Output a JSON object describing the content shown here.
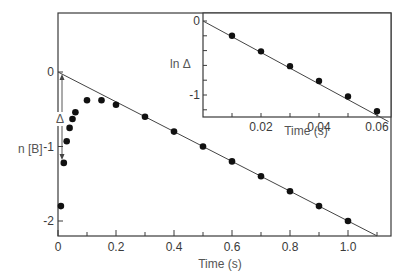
{
  "chart_data": [
    {
      "type": "scatter",
      "title": "",
      "xlabel": "Time (s)",
      "ylabel": "n [B]",
      "xlim": [
        0,
        1.15
      ],
      "ylim": [
        -2.2,
        0.75
      ],
      "xticks": [
        0,
        0.2,
        0.4,
        0.6,
        0.8,
        1.0
      ],
      "xtick_labels": [
        "0",
        "0.2",
        "0.4",
        "0.6",
        "0.8",
        "1.0"
      ],
      "yticks": [
        0,
        -1,
        -2
      ],
      "ytick_labels": [
        "0",
        "-1",
        "-2"
      ],
      "grid": false,
      "annotations": [
        {
          "text": "Δ",
          "x": 0.005,
          "y": -0.6,
          "note": "double arrow from fitted line at t=0 down to data"
        }
      ],
      "series": [
        {
          "name": "data",
          "x": [
            0.01,
            0.02,
            0.03,
            0.04,
            0.05,
            0.06,
            0.1,
            0.15,
            0.2,
            0.3,
            0.4,
            0.5,
            0.6,
            0.7,
            0.8,
            0.9,
            1.0
          ],
          "y": [
            -1.8,
            -1.22,
            -0.93,
            -0.75,
            -0.63,
            -0.54,
            -0.38,
            -0.38,
            -0.44,
            -0.6,
            -0.8,
            -1.0,
            -1.2,
            -1.4,
            -1.6,
            -1.8,
            -2.0
          ]
        },
        {
          "name": "fit line",
          "type": "line",
          "x": [
            0,
            1.1
          ],
          "y": [
            0,
            -2.2
          ]
        }
      ]
    },
    {
      "type": "scatter",
      "title": "",
      "inset": true,
      "xlabel": "Time (s)",
      "ylabel": "ln Δ",
      "xlim": [
        0,
        0.064
      ],
      "ylim": [
        -1.4,
        0.1
      ],
      "xticks": [
        0.01,
        0.02,
        0.03,
        0.04,
        0.05,
        0.06
      ],
      "xtick_labels": [
        "",
        "0.02",
        "",
        "0.04",
        "",
        "0.06"
      ],
      "yticks": [
        0,
        -0.2,
        -0.4,
        -0.6,
        -0.8,
        -1.0,
        -1.2
      ],
      "ytick_labels": [
        "0",
        "",
        "",
        "",
        "",
        "-1",
        ""
      ],
      "grid": false,
      "series": [
        {
          "name": "data",
          "x": [
            0.01,
            0.02,
            0.03,
            0.04,
            0.05,
            0.06
          ],
          "y": [
            -0.2,
            -0.41,
            -0.61,
            -0.81,
            -1.02,
            -1.22
          ]
        },
        {
          "name": "fit line",
          "type": "line",
          "x": [
            0,
            0.064
          ],
          "y": [
            0,
            -1.36
          ]
        }
      ]
    }
  ],
  "labels": {
    "main_ylabel": "n [B]",
    "main_xlabel": "Time (s)",
    "inset_ylabel": "ln Δ",
    "inset_xlabel": "Time (s)",
    "delta": "Δ"
  }
}
